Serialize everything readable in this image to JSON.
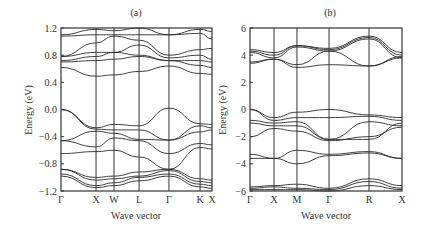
{
  "chart_data": [
    {
      "type": "line",
      "panel_label": "(a)",
      "title": "(a)",
      "xlabel": "Wave vector",
      "ylabel": "Energy (eV)",
      "ylim": [
        -1.2,
        1.2
      ],
      "yticks": [
        1.2,
        0.8,
        0.4,
        0.0,
        -0.4,
        -0.8,
        -1.2
      ],
      "ytick_labels": [
        "1.2",
        "0.8",
        "0.4",
        "0.0",
        "−0.4",
        "−0.8",
        "−1.2"
      ],
      "kpath": [
        "Γ",
        "X",
        "W",
        "L",
        "Γ",
        "K",
        "X"
      ],
      "kpath_positions": [
        0,
        0.232,
        0.351,
        0.517,
        0.715,
        0.921,
        1.0
      ],
      "grid": false,
      "description": "Electronic band structure; valence band maximum at Gamma at 0 eV, conduction bands 0.5-1.2 eV",
      "series": [
        {
          "name": "cb1",
          "x": [
            0,
            0.232,
            0.351,
            0.517,
            0.715,
            0.921,
            1.0
          ],
          "y": [
            0.62,
            0.49,
            0.51,
            0.56,
            0.64,
            0.53,
            0.52
          ]
        },
        {
          "name": "cb2",
          "x": [
            0,
            0.232,
            0.351,
            0.517,
            0.715,
            0.921,
            1.0
          ],
          "y": [
            0.7,
            0.72,
            0.74,
            0.78,
            0.72,
            0.65,
            0.62
          ]
        },
        {
          "name": "cb3",
          "x": [
            0,
            0.232,
            0.351,
            0.517,
            0.715,
            0.921,
            1.0
          ],
          "y": [
            0.72,
            0.78,
            0.84,
            0.8,
            0.72,
            0.72,
            0.7
          ]
        },
        {
          "name": "cb4",
          "x": [
            0,
            0.232,
            0.351,
            0.517,
            0.715,
            0.921,
            1.0
          ],
          "y": [
            0.78,
            0.84,
            0.84,
            0.95,
            0.76,
            0.8,
            0.74
          ]
        },
        {
          "name": "cb5",
          "x": [
            0,
            0.232,
            0.351,
            0.517,
            0.715,
            0.921,
            1.0
          ],
          "y": [
            0.78,
            0.98,
            1.08,
            1.02,
            0.8,
            0.88,
            0.9
          ]
        },
        {
          "name": "cb6",
          "x": [
            0,
            0.232,
            0.351,
            0.517,
            0.715,
            0.921,
            1.0
          ],
          "y": [
            1.08,
            1.1,
            1.1,
            1.1,
            1.1,
            1.12,
            1.04
          ]
        },
        {
          "name": "cb7",
          "x": [
            0,
            0.232,
            0.351,
            0.517,
            0.715,
            0.921,
            1.0
          ],
          "y": [
            1.1,
            1.18,
            1.16,
            1.2,
            1.1,
            1.18,
            1.15
          ]
        },
        {
          "name": "vb1",
          "x": [
            0,
            0.232,
            0.351,
            0.517,
            0.715,
            0.921,
            1.0
          ],
          "y": [
            0.0,
            -0.27,
            -0.22,
            -0.24,
            0.02,
            -0.21,
            -0.22
          ]
        },
        {
          "name": "vb2",
          "x": [
            0,
            0.232,
            0.351,
            0.517,
            0.715,
            0.921,
            1.0
          ],
          "y": [
            0.0,
            -0.29,
            -0.3,
            -0.3,
            -0.45,
            -0.24,
            -0.27
          ]
        },
        {
          "name": "vb3",
          "x": [
            0,
            0.232,
            0.351,
            0.517,
            0.715,
            0.921,
            1.0
          ],
          "y": [
            -0.46,
            -0.32,
            -0.35,
            -0.44,
            -0.45,
            -0.33,
            -0.3
          ]
        },
        {
          "name": "vb4",
          "x": [
            0,
            0.232,
            0.351,
            0.517,
            0.715,
            0.921,
            1.0
          ],
          "y": [
            -0.46,
            -0.55,
            -0.42,
            -0.46,
            -0.65,
            -0.5,
            -0.52
          ]
        },
        {
          "name": "vb5",
          "x": [
            0,
            0.232,
            0.351,
            0.517,
            0.715,
            0.921,
            1.0
          ],
          "y": [
            -0.65,
            -0.62,
            -0.6,
            -0.7,
            -0.88,
            -0.56,
            -0.58
          ]
        },
        {
          "name": "vb6",
          "x": [
            0,
            0.232,
            0.351,
            0.517,
            0.715,
            0.921,
            1.0
          ],
          "y": [
            -0.88,
            -1.0,
            -0.98,
            -0.92,
            -0.88,
            -1.02,
            -1.04
          ]
        },
        {
          "name": "vb7",
          "x": [
            0,
            0.232,
            0.351,
            0.517,
            0.715,
            0.921,
            1.0
          ],
          "y": [
            -0.88,
            -1.04,
            -1.02,
            -0.98,
            -0.9,
            -1.06,
            -1.08
          ]
        },
        {
          "name": "vb8",
          "x": [
            0,
            0.232,
            0.351,
            0.517,
            0.715,
            0.921,
            1.0
          ],
          "y": [
            -0.95,
            -1.12,
            -1.08,
            -1.0,
            -0.95,
            -1.1,
            -1.12
          ]
        },
        {
          "name": "vb9",
          "x": [
            0,
            0.232,
            0.351,
            0.517,
            0.715,
            0.921,
            1.0
          ],
          "y": [
            -0.98,
            -1.15,
            -1.12,
            -1.05,
            -0.98,
            -1.14,
            -1.16
          ]
        }
      ]
    },
    {
      "type": "line",
      "panel_label": "(b)",
      "title": "(b)",
      "xlabel": "Wave vector",
      "ylabel": "Energy (eV)",
      "ylim": [
        -6,
        6
      ],
      "yticks": [
        6,
        4,
        2,
        0,
        -2,
        -4,
        -6
      ],
      "ytick_labels": [
        "6",
        "4",
        "2",
        "0",
        "−2",
        "−4",
        "−6"
      ],
      "kpath": [
        "Γ",
        "X",
        "M",
        "Γ",
        "R",
        "X"
      ],
      "kpath_positions": [
        0,
        0.158,
        0.309,
        0.52,
        0.783,
        1.0
      ],
      "grid": false,
      "description": "Electronic band structure; valence band maximum at Gamma at 0 eV, conduction bands 3-6 eV",
      "series": [
        {
          "name": "cb1",
          "x": [
            0,
            0.158,
            0.309,
            0.52,
            0.783,
            1.0
          ],
          "y": [
            3.4,
            3.7,
            3.1,
            3.3,
            3.2,
            3.8
          ]
        },
        {
          "name": "cb2",
          "x": [
            0,
            0.158,
            0.309,
            0.52,
            0.783,
            1.0
          ],
          "y": [
            3.5,
            3.7,
            3.3,
            4.3,
            3.2,
            3.9
          ]
        },
        {
          "name": "cb3",
          "x": [
            0,
            0.158,
            0.309,
            0.52,
            0.783,
            1.0
          ],
          "y": [
            4.2,
            3.8,
            4.6,
            4.3,
            5.2,
            3.8
          ]
        },
        {
          "name": "cb4",
          "x": [
            0,
            0.158,
            0.309,
            0.52,
            0.783,
            1.0
          ],
          "y": [
            4.3,
            4.0,
            4.7,
            4.4,
            5.3,
            4.0
          ]
        },
        {
          "name": "cb5",
          "x": [
            0,
            0.158,
            0.309,
            0.52,
            0.783,
            1.0
          ],
          "y": [
            4.4,
            4.2,
            4.7,
            4.5,
            5.4,
            4.2
          ]
        },
        {
          "name": "vb1",
          "x": [
            0,
            0.158,
            0.309,
            0.52,
            0.783,
            1.0
          ],
          "y": [
            0.0,
            -0.6,
            -0.2,
            0.0,
            -0.4,
            -0.6
          ]
        },
        {
          "name": "vb2",
          "x": [
            0,
            0.158,
            0.309,
            0.52,
            0.783,
            1.0
          ],
          "y": [
            0.0,
            -0.8,
            -0.6,
            -0.6,
            -0.5,
            -0.8
          ]
        },
        {
          "name": "vb3",
          "x": [
            0,
            0.158,
            0.309,
            0.52,
            0.783,
            1.0
          ],
          "y": [
            -0.8,
            -1.0,
            -0.9,
            -2.2,
            -2.2,
            -1.0
          ]
        },
        {
          "name": "vb4",
          "x": [
            0,
            0.158,
            0.309,
            0.52,
            0.783,
            1.0
          ],
          "y": [
            -1.0,
            -1.2,
            -1.2,
            -2.2,
            -0.9,
            -1.2
          ]
        },
        {
          "name": "vb5",
          "x": [
            0,
            0.158,
            0.309,
            0.52,
            0.783,
            1.0
          ],
          "y": [
            -2.0,
            -1.4,
            -1.6,
            -2.3,
            -2.0,
            -1.3
          ]
        },
        {
          "name": "vb6",
          "x": [
            0,
            0.158,
            0.309,
            0.52,
            0.783,
            1.0
          ],
          "y": [
            -3.3,
            -3.6,
            -3.0,
            -3.3,
            -3.1,
            -3.6
          ]
        },
        {
          "name": "vb7",
          "x": [
            0,
            0.158,
            0.309,
            0.52,
            0.783,
            1.0
          ],
          "y": [
            -3.6,
            -3.6,
            -4.0,
            -3.4,
            -3.2,
            -3.6
          ]
        },
        {
          "name": "vb8",
          "x": [
            0,
            0.158,
            0.309,
            0.52,
            0.783,
            1.0
          ],
          "y": [
            -5.7,
            -5.6,
            -5.5,
            -5.8,
            -5.1,
            -5.6
          ]
        },
        {
          "name": "vb9",
          "x": [
            0,
            0.158,
            0.309,
            0.52,
            0.783,
            1.0
          ],
          "y": [
            -5.8,
            -5.7,
            -5.8,
            -5.9,
            -5.3,
            -5.8
          ]
        },
        {
          "name": "vb10",
          "x": [
            0,
            0.158,
            0.309,
            0.52,
            0.783,
            1.0
          ],
          "y": [
            -5.9,
            -5.9,
            -5.9,
            -6.0,
            -5.6,
            -5.9
          ]
        }
      ]
    }
  ],
  "panel_a": {
    "label": "(a)",
    "ylabel": "Energy (eV)",
    "xlabel": "Wave vector",
    "yticks": [
      "1.2",
      "0.8",
      "0.4",
      "0.0",
      "−0.4",
      "−0.8",
      "−1.2"
    ],
    "kpoints": [
      "Γ",
      "X",
      "W",
      "L",
      "Γ",
      "K",
      "X"
    ]
  },
  "panel_b": {
    "label": "(b)",
    "ylabel": "Energy (eV)",
    "xlabel": "Wave vector",
    "yticks": [
      "6",
      "4",
      "2",
      "0",
      "−2",
      "−4",
      "−6"
    ],
    "kpoints": [
      "Γ",
      "X",
      "M",
      "Γ",
      "R",
      "X"
    ]
  },
  "colors": {
    "line": "#2a2a2a",
    "frame": "#333333",
    "text": "#333333",
    "background": "#ffffff"
  }
}
